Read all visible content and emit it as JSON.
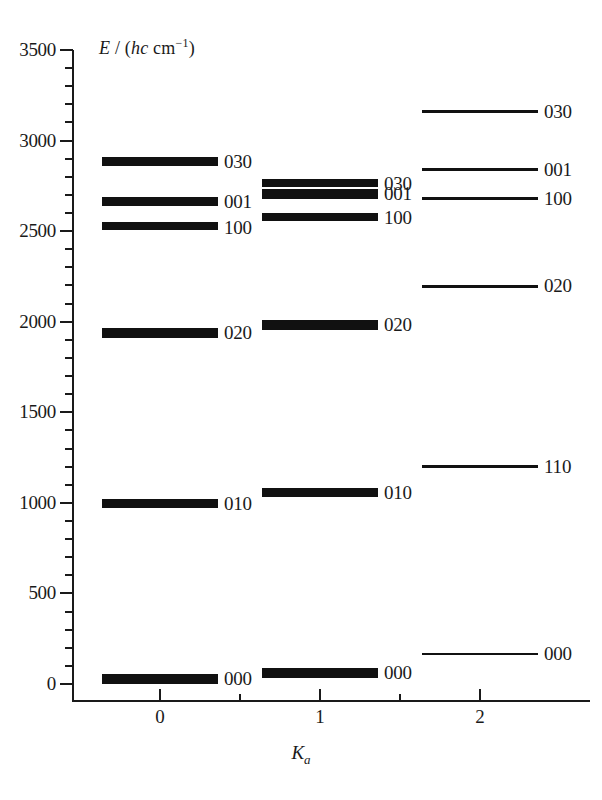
{
  "chart_data": {
    "type": "line",
    "title": "",
    "xlabel": "Ka",
    "ylabel": "E / (hc cm-1)",
    "ylim": [
      0,
      3500
    ],
    "xlim": [
      -0.35,
      2.6
    ],
    "ytick_values": [
      0,
      500,
      1000,
      1500,
      2000,
      2500,
      3000,
      3500
    ],
    "ytick_labels": [
      "0",
      "500",
      "1000",
      "1500",
      "2000",
      "2500",
      "3000",
      "3500"
    ],
    "yminor_step": 100,
    "xtick_values": [
      0,
      1,
      2
    ],
    "xtick_labels": [
      "0",
      "1",
      "2"
    ],
    "xminor_values": [
      0.5,
      1.5
    ],
    "grid": false,
    "legend": false,
    "columns": [
      {
        "ka": "0",
        "x": 0,
        "levels": [
          {
            "label": "030",
            "energy": 2880,
            "sublevels": [
              2900,
              2888,
              2877,
              2866
            ]
          },
          {
            "label": "001",
            "energy": 2660,
            "sublevels": [
              2682,
              2670,
              2657,
              2645
            ]
          },
          {
            "label": "100",
            "energy": 2520,
            "sublevels": [
              2540,
              2528,
              2515
            ]
          },
          {
            "label": "020",
            "energy": 1935,
            "sublevels": [
              1955,
              1943,
              1930,
              1918
            ]
          },
          {
            "label": "010",
            "energy": 995,
            "sublevels": [
              1015,
              1003,
              990,
              978
            ]
          },
          {
            "label": "000",
            "energy": 25,
            "sublevels": [
              45,
              33,
              20,
              8
            ]
          }
        ]
      },
      {
        "ka": "1",
        "x": 1,
        "levels": [
          {
            "label": "030",
            "energy": 2760,
            "sublevels": [
              2778,
              2766,
              2754
            ]
          },
          {
            "label": "001",
            "energy": 2705,
            "sublevels": [
              2724,
              2712,
              2700,
              2688
            ]
          },
          {
            "label": "100",
            "energy": 2570,
            "sublevels": [
              2590,
              2578,
              2565
            ]
          },
          {
            "label": "020",
            "energy": 1980,
            "sublevels": [
              2000,
              1988,
              1975,
              1963
            ]
          },
          {
            "label": "010",
            "energy": 1055,
            "sublevels": [
              1075,
              1063,
              1050,
              1038
            ]
          },
          {
            "label": "000",
            "energy": 60,
            "sublevels": [
              80,
              68,
              55,
              43
            ]
          }
        ]
      },
      {
        "ka": "2",
        "x": 2,
        "levels": [
          {
            "label": "030",
            "energy": 3160,
            "sublevels": [
              3160
            ]
          },
          {
            "label": "001",
            "energy": 2840,
            "sublevels": [
              2840
            ]
          },
          {
            "label": "100",
            "energy": 2680,
            "sublevels": [
              2680
            ]
          },
          {
            "label": "020",
            "energy": 2195,
            "sublevels": [
              2195
            ]
          },
          {
            "label": "110",
            "energy": 1200,
            "sublevels": [
              1200
            ]
          },
          {
            "label": "000",
            "energy": 165,
            "sublevels": [
              165
            ]
          }
        ]
      }
    ]
  },
  "axis": {
    "y_title_E": "E",
    "y_title_slash": " / (",
    "y_title_hc": "hc",
    "y_title_cm": " cm",
    "y_title_exp": "−1",
    "y_title_close": ")",
    "x_title_K": "K",
    "x_title_sub": "a"
  }
}
